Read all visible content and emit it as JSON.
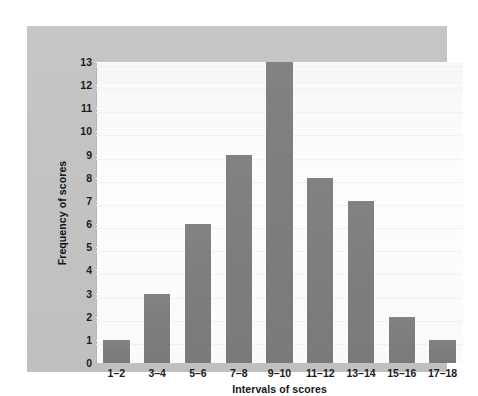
{
  "chart_data": {
    "type": "bar",
    "title": "",
    "subtitle": "",
    "xlabel": "Intervals of scores",
    "ylabel": "Frequency of scores",
    "categories": [
      "1–2",
      "3–4",
      "5–6",
      "7–8",
      "9–10",
      "11–12",
      "13–14",
      "15–16",
      "17–18"
    ],
    "values": [
      1,
      3,
      6,
      9,
      13,
      8,
      7,
      2,
      1
    ],
    "ylim": [
      0,
      13
    ],
    "yticks": [
      0,
      1,
      2,
      3,
      4,
      5,
      6,
      7,
      8,
      9,
      10,
      11,
      12,
      13
    ],
    "ytick_labels": [
      "0",
      "1",
      "2",
      "3",
      "4",
      "5",
      "6",
      "7",
      "8",
      "9",
      "10",
      "11",
      "12",
      "13"
    ],
    "grid": true,
    "grid_axis": "y",
    "legend": false,
    "legend_position": "none",
    "bar_color": "#7f7f7f",
    "plot_background": "#fbfbfb",
    "panel_background": "#c4c4c4",
    "page_background": "#ffffff",
    "text_color": "#1b1b1b"
  }
}
